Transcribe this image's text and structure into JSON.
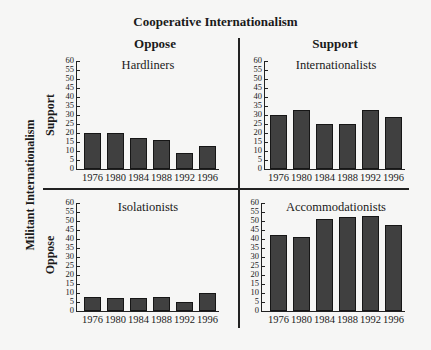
{
  "chart_data": {
    "type": "bar",
    "title": "Cooperative Internationalism",
    "column_axis": {
      "title": "Cooperative Internationalism",
      "labels": [
        "Oppose",
        "Support"
      ]
    },
    "row_axis": {
      "title": "Militant Internationalism",
      "labels": [
        "Support",
        "Oppose"
      ]
    },
    "categories": [
      "1976",
      "1980",
      "1984",
      "1988",
      "1992",
      "1996"
    ],
    "y_ticks": [
      0,
      5,
      10,
      15,
      20,
      25,
      30,
      35,
      40,
      45,
      50,
      55,
      60
    ],
    "ylim": [
      0,
      60
    ],
    "grid": false,
    "panels": [
      {
        "name": "Hardliners",
        "row": "Support",
        "col": "Oppose",
        "values": [
          20,
          20,
          17,
          16,
          9,
          13
        ]
      },
      {
        "name": "Internationalists",
        "row": "Support",
        "col": "Support",
        "values": [
          30,
          33,
          25,
          25,
          33,
          29
        ]
      },
      {
        "name": "Isolationists",
        "row": "Oppose",
        "col": "Oppose",
        "values": [
          8,
          7,
          7,
          8,
          5,
          10
        ]
      },
      {
        "name": "Accommodationists",
        "row": "Oppose",
        "col": "Support",
        "values": [
          42,
          41,
          51,
          52,
          53,
          48
        ]
      }
    ],
    "colors": {
      "bar": "#404040",
      "bar_border": "#161616",
      "background": "#f6f6f5"
    }
  }
}
